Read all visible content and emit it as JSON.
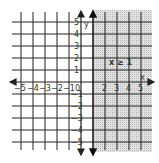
{
  "graph": {
    "inequality": "x ≥ 1",
    "x_axis_label": "x",
    "y_axis_label": "y",
    "x_ticks": [
      "−5",
      "−4",
      "−3",
      "−2",
      "−1",
      "0",
      "2",
      "3",
      "4",
      "5"
    ],
    "y_ticks": [
      "5",
      "4",
      "3",
      "2",
      "1",
      "−1",
      "−2",
      "−3",
      "−4",
      "−5"
    ],
    "boundary": 1,
    "boundary_type": "solid",
    "shaded_region": "right",
    "shade_color": "#d4d4d4",
    "grid_color": "#222222"
  }
}
